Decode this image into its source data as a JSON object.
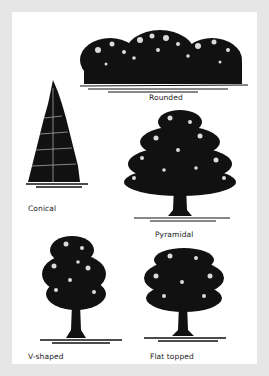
{
  "figure": {
    "background_color": "#e6e6e6",
    "panel_color": "#ffffff",
    "ink_color": "#111111",
    "trees": [
      {
        "id": "rounded",
        "label": "Rounded"
      },
      {
        "id": "conical",
        "label": "Conical"
      },
      {
        "id": "pyramidal",
        "label": "Pyramidal"
      },
      {
        "id": "v-shaped",
        "label": "V-shaped"
      },
      {
        "id": "flat-topped",
        "label": "Flat topped"
      }
    ]
  }
}
